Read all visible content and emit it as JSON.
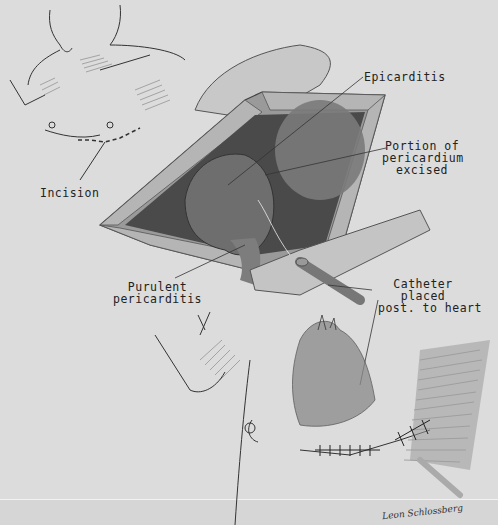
{
  "figure": {
    "colors": {
      "background": "#dcdcdc",
      "ink": "#222222",
      "tissue_dark": "#3a3a3a"
    },
    "labels": {
      "incision": "Incision",
      "epicarditis": "Epicarditis",
      "pericardium_line1": "Portion of",
      "pericardium_line2": "pericardium",
      "pericardium_line3": "excised",
      "purulent_line1": "Purulent",
      "purulent_line2": "pericarditis",
      "catheter_line1": "Catheter",
      "catheter_line2": "placed",
      "catheter_line3": "post. to heart"
    },
    "signature": "Leon Schlossberg"
  }
}
